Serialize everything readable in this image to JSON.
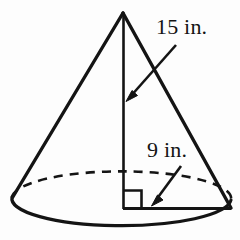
{
  "figure": {
    "name": "cone-diagram",
    "type": "geometry-solid",
    "shape": "cone",
    "stroke_color": "#141414",
    "background_color": "#fdfdfd",
    "labels": [
      {
        "id": "slant-length",
        "text": "15 in.",
        "value": 15,
        "unit": "in.",
        "measures": "slant-height"
      },
      {
        "id": "base-radius",
        "text": "9 in.",
        "value": 9,
        "unit": "in.",
        "measures": "radius"
      }
    ],
    "markers": {
      "right_angle": "90-degree square at base center"
    }
  },
  "geometry": {
    "apex": {
      "x": 123,
      "y": 13
    },
    "base_center": {
      "x": 123,
      "y": 200
    },
    "base_left": {
      "x": 12,
      "y": 197
    },
    "base_right": {
      "x": 231,
      "y": 200
    },
    "base_rx": 109,
    "base_ry": 27,
    "axis_bottom": {
      "x": 123,
      "y": 208
    },
    "radius_end": {
      "x": 231,
      "y": 208
    },
    "right_angle_square": {
      "x": 124,
      "y": 190,
      "size": 18
    },
    "arrow_slant": {
      "x1": 176,
      "y1": 45,
      "x2": 127,
      "y2": 100
    },
    "arrow_radius": {
      "x1": 181,
      "y1": 166,
      "x2": 152,
      "y2": 205
    }
  }
}
